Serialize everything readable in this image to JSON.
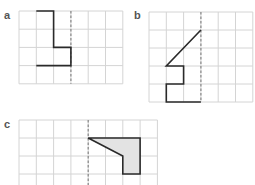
{
  "panels": [
    {
      "label": "a",
      "cols": 6,
      "rows": 4,
      "origin": [
        19,
        11
      ],
      "cell": [
        17.3,
        18.2
      ],
      "mirror_col": 3,
      "shape": [
        [
          1,
          0
        ],
        [
          2,
          0
        ],
        [
          2,
          2
        ],
        [
          3,
          2
        ],
        [
          3,
          3
        ],
        [
          1,
          3
        ]
      ],
      "closed": false,
      "filled": false
    },
    {
      "label": "b",
      "cols": 6,
      "rows": 5,
      "origin": [
        149,
        12
      ],
      "cell": [
        17.3,
        18.0
      ],
      "mirror_col": 3,
      "shape": [
        [
          3,
          1
        ],
        [
          1,
          3
        ],
        [
          2,
          3
        ],
        [
          2,
          4
        ],
        [
          1,
          4
        ],
        [
          1,
          5
        ],
        [
          3,
          5
        ]
      ],
      "closed": false,
      "filled": false
    },
    {
      "label": "c",
      "cols": 8,
      "rows": 4,
      "origin": [
        19,
        120
      ],
      "cell": [
        17.3,
        18.0
      ],
      "mirror_col": 4,
      "shape": [
        [
          4,
          1
        ],
        [
          7,
          1
        ],
        [
          7,
          3
        ],
        [
          6,
          3
        ],
        [
          6,
          2
        ]
      ],
      "closed": true,
      "filled": true
    }
  ],
  "colors": {
    "grid": "#d4d4d4",
    "shape_stroke": "#2a2a2a",
    "mirror_line": "#888888",
    "fill": "#e3e3e3",
    "label": "#555555"
  }
}
